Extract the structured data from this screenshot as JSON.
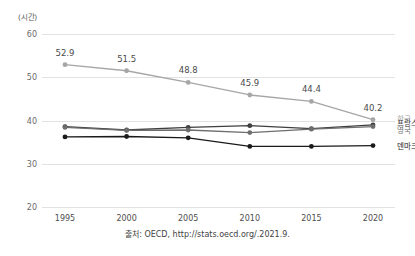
{
  "axis": {
    "unit_label": "(시간)",
    "y_ticks": [
      "60",
      "50",
      "40",
      "30",
      "20"
    ],
    "x_ticks": [
      "1995",
      "2000",
      "2005",
      "2010",
      "2015",
      "2020"
    ]
  },
  "caption": "출처: OECD, http://stats.oecd.org/.2021.9.",
  "legend": [
    {
      "label": "한국",
      "color": "#a6a6a6"
    },
    {
      "label": "프랑스",
      "color": "#3f3f3f"
    },
    {
      "label": "영국",
      "color": "#6e6e6e"
    },
    {
      "label": "덴마크",
      "color": "#1a1a1a"
    }
  ],
  "chart_data": {
    "type": "line",
    "title": "",
    "xlabel": "",
    "ylabel": "(시간)",
    "categories": [
      "1995",
      "2000",
      "2005",
      "2010",
      "2015",
      "2020"
    ],
    "x": [
      1995,
      2000,
      2005,
      2010,
      2015,
      2020
    ],
    "ylim": [
      20,
      60
    ],
    "ytick_step": 10,
    "grid": "horizontal",
    "legend_position": "right-inline",
    "series": [
      {
        "name": "한국",
        "color": "#a6a6a6",
        "values": [
          52.9,
          51.5,
          48.8,
          45.9,
          44.4,
          40.2
        ],
        "data_labels": [
          "52.9",
          "51.5",
          "48.8",
          "45.9",
          "44.4",
          "40.2"
        ]
      },
      {
        "name": "프랑스",
        "color": "#3f3f3f",
        "values": [
          38.6,
          37.8,
          38.4,
          38.8,
          38.1,
          39.0
        ],
        "data_labels": []
      },
      {
        "name": "영국",
        "color": "#6e6e6e",
        "values": [
          38.4,
          37.7,
          37.8,
          37.2,
          38.0,
          38.6
        ],
        "data_labels": []
      },
      {
        "name": "덴마크",
        "color": "#1a1a1a",
        "values": [
          36.2,
          36.3,
          36.0,
          34.0,
          34.0,
          34.2
        ],
        "data_labels": []
      }
    ],
    "annotations": [
      "출처: OECD, http://stats.oecd.org/.2021.9."
    ]
  }
}
